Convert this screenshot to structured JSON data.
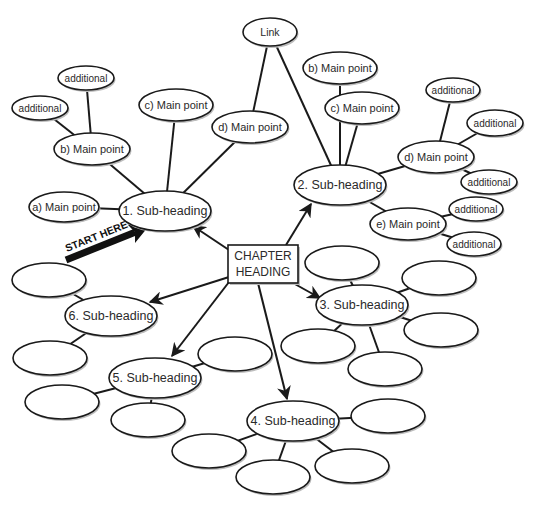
{
  "chart_data": {
    "type": "diagram",
    "start_label": "START HERE",
    "center": {
      "id": "chapter",
      "label_lines": [
        "CHAPTER",
        "HEADING"
      ],
      "x": 263,
      "y": 264,
      "w": 70,
      "h": 38
    },
    "nodes": [
      {
        "id": "link",
        "label": "Link",
        "x": 270,
        "y": 32,
        "rx": 27,
        "ry": 14,
        "kind": "link"
      },
      {
        "id": "s1",
        "label": "1. Sub-heading",
        "x": 165,
        "y": 211,
        "rx": 46,
        "ry": 20,
        "kind": "sub"
      },
      {
        "id": "s1a",
        "label": "a) Main point",
        "x": 64,
        "y": 207,
        "rx": 35,
        "ry": 15,
        "kind": "main"
      },
      {
        "id": "s1b",
        "label": "b) Main point",
        "x": 92,
        "y": 149,
        "rx": 38,
        "ry": 16,
        "kind": "main"
      },
      {
        "id": "s1c",
        "label": "c) Main point",
        "x": 176,
        "y": 105,
        "rx": 37,
        "ry": 16,
        "kind": "main"
      },
      {
        "id": "s1d",
        "label": "d) Main point",
        "x": 250,
        "y": 127,
        "rx": 38,
        "ry": 16,
        "kind": "main"
      },
      {
        "id": "s1b1",
        "label": "additional",
        "x": 86,
        "y": 78,
        "rx": 28,
        "ry": 12,
        "kind": "add"
      },
      {
        "id": "s1b2",
        "label": "additional",
        "x": 40,
        "y": 108,
        "rx": 28,
        "ry": 12,
        "kind": "add"
      },
      {
        "id": "s2",
        "label": "2. Sub-heading",
        "x": 340,
        "y": 185,
        "rx": 46,
        "ry": 20,
        "kind": "sub"
      },
      {
        "id": "s2b",
        "label": "b) Main point",
        "x": 340,
        "y": 68,
        "rx": 37,
        "ry": 16,
        "kind": "main"
      },
      {
        "id": "s2c",
        "label": "c) Main point",
        "x": 362,
        "y": 108,
        "rx": 37,
        "ry": 16,
        "kind": "main"
      },
      {
        "id": "s2d",
        "label": "d) Main point",
        "x": 436,
        "y": 157,
        "rx": 38,
        "ry": 16,
        "kind": "main"
      },
      {
        "id": "s2e",
        "label": "e) Main point",
        "x": 408,
        "y": 224,
        "rx": 38,
        "ry": 16,
        "kind": "main"
      },
      {
        "id": "s2d1",
        "label": "additional",
        "x": 453,
        "y": 90,
        "rx": 27,
        "ry": 12,
        "kind": "add"
      },
      {
        "id": "s2d2",
        "label": "additional",
        "x": 495,
        "y": 123,
        "rx": 28,
        "ry": 13,
        "kind": "add"
      },
      {
        "id": "s2d3",
        "label": "additional",
        "x": 489,
        "y": 182,
        "rx": 28,
        "ry": 12,
        "kind": "add"
      },
      {
        "id": "s2e1",
        "label": "additional",
        "x": 476,
        "y": 209,
        "rx": 27,
        "ry": 12,
        "kind": "add"
      },
      {
        "id": "s2e2",
        "label": "additional",
        "x": 474,
        "y": 244,
        "rx": 27,
        "ry": 12,
        "kind": "add"
      },
      {
        "id": "s3",
        "label": "3. Sub-heading",
        "x": 362,
        "y": 305,
        "rx": 46,
        "ry": 20,
        "kind": "sub"
      },
      {
        "id": "s3e1",
        "label": "",
        "x": 342,
        "y": 263,
        "rx": 37,
        "ry": 17,
        "kind": "empty"
      },
      {
        "id": "s3e2",
        "label": "",
        "x": 439,
        "y": 278,
        "rx": 37,
        "ry": 17,
        "kind": "empty"
      },
      {
        "id": "s3e3",
        "label": "",
        "x": 441,
        "y": 330,
        "rx": 37,
        "ry": 17,
        "kind": "empty"
      },
      {
        "id": "s3e4",
        "label": "",
        "x": 318,
        "y": 346,
        "rx": 37,
        "ry": 17,
        "kind": "empty"
      },
      {
        "id": "s3e5",
        "label": "",
        "x": 385,
        "y": 369,
        "rx": 37,
        "ry": 17,
        "kind": "empty"
      },
      {
        "id": "s4",
        "label": "4. Sub-heading",
        "x": 293,
        "y": 421,
        "rx": 46,
        "ry": 20,
        "kind": "sub"
      },
      {
        "id": "s4e1",
        "label": "",
        "x": 388,
        "y": 416,
        "rx": 37,
        "ry": 17,
        "kind": "empty"
      },
      {
        "id": "s4e2",
        "label": "",
        "x": 209,
        "y": 451,
        "rx": 37,
        "ry": 17,
        "kind": "empty"
      },
      {
        "id": "s4e3",
        "label": "",
        "x": 273,
        "y": 477,
        "rx": 37,
        "ry": 17,
        "kind": "empty"
      },
      {
        "id": "s4e4",
        "label": "",
        "x": 352,
        "y": 466,
        "rx": 37,
        "ry": 17,
        "kind": "empty"
      },
      {
        "id": "s5",
        "label": "5. Sub-heading",
        "x": 155,
        "y": 378,
        "rx": 46,
        "ry": 20,
        "kind": "sub"
      },
      {
        "id": "s5e1",
        "label": "",
        "x": 235,
        "y": 354,
        "rx": 37,
        "ry": 17,
        "kind": "empty"
      },
      {
        "id": "s5e2",
        "label": "",
        "x": 62,
        "y": 402,
        "rx": 37,
        "ry": 17,
        "kind": "empty"
      },
      {
        "id": "s5e3",
        "label": "",
        "x": 148,
        "y": 420,
        "rx": 37,
        "ry": 17,
        "kind": "empty"
      },
      {
        "id": "s6",
        "label": "6. Sub-heading",
        "x": 111,
        "y": 316,
        "rx": 46,
        "ry": 20,
        "kind": "sub"
      },
      {
        "id": "s6e1",
        "label": "",
        "x": 49,
        "y": 280,
        "rx": 37,
        "ry": 17,
        "kind": "empty"
      },
      {
        "id": "s6e2",
        "label": "",
        "x": 50,
        "y": 358,
        "rx": 37,
        "ry": 17,
        "kind": "empty"
      }
    ],
    "arrows": [
      {
        "from": "chapter",
        "to": "s1",
        "x1": 229,
        "y1": 250,
        "x2": 193,
        "y2": 226
      },
      {
        "from": "chapter",
        "to": "s2",
        "x1": 286,
        "y1": 245,
        "x2": 311,
        "y2": 204
      },
      {
        "from": "chapter",
        "to": "s3",
        "x1": 293,
        "y1": 283,
        "x2": 320,
        "y2": 298
      },
      {
        "from": "chapter",
        "to": "s4",
        "x1": 258,
        "y1": 283,
        "x2": 287,
        "y2": 399
      },
      {
        "from": "chapter",
        "to": "s5",
        "x1": 229,
        "y1": 282,
        "x2": 172,
        "y2": 356
      },
      {
        "from": "chapter",
        "to": "s6",
        "x1": 229,
        "y1": 277,
        "x2": 150,
        "y2": 302
      }
    ],
    "edges": [
      [
        "s1",
        "s1a"
      ],
      [
        "s1",
        "s1b"
      ],
      [
        "s1",
        "s1c"
      ],
      [
        "s1",
        "s1d"
      ],
      [
        "s1b",
        "s1b1"
      ],
      [
        "s1b",
        "s1b2"
      ],
      [
        "s1d",
        "link"
      ],
      [
        "link",
        "s2"
      ],
      [
        "s2",
        "s2b"
      ],
      [
        "s2",
        "s2c"
      ],
      [
        "s2",
        "s2d"
      ],
      [
        "s2",
        "s2e"
      ],
      [
        "s2d",
        "s2d1"
      ],
      [
        "s2d",
        "s2d2"
      ],
      [
        "s2d",
        "s2d3"
      ],
      [
        "s2e",
        "s2e1"
      ],
      [
        "s2e",
        "s2e2"
      ],
      [
        "s3",
        "s3e1"
      ],
      [
        "s3",
        "s3e2"
      ],
      [
        "s3",
        "s3e3"
      ],
      [
        "s3",
        "s3e4"
      ],
      [
        "s3",
        "s3e5"
      ],
      [
        "s4",
        "s4e1"
      ],
      [
        "s4",
        "s4e2"
      ],
      [
        "s4",
        "s4e3"
      ],
      [
        "s4",
        "s4e4"
      ],
      [
        "s5",
        "s5e1"
      ],
      [
        "s5",
        "s5e2"
      ],
      [
        "s5",
        "s5e3"
      ],
      [
        "s6",
        "s6e1"
      ],
      [
        "s6",
        "s6e2"
      ]
    ],
    "start_arrow": {
      "x1": 66,
      "y1": 260,
      "x2": 148,
      "y2": 227
    }
  }
}
